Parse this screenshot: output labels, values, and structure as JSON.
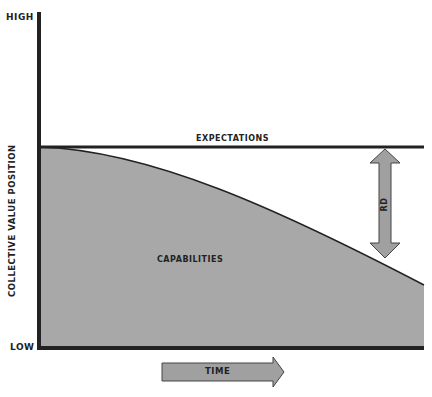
{
  "diagram": {
    "y_axis": {
      "label": "COLLECTIVE VALUE POSITION",
      "high": "HIGH",
      "low": "LOW"
    },
    "x_axis": {
      "label": "TIME"
    },
    "lines": {
      "expectations": "EXPECTATIONS",
      "capabilities": "CAPABILITIES"
    },
    "gap_label": "RD",
    "colors": {
      "fill": "#a8a8a8",
      "line": "#222222",
      "arrow": "#a0a0a0"
    }
  }
}
